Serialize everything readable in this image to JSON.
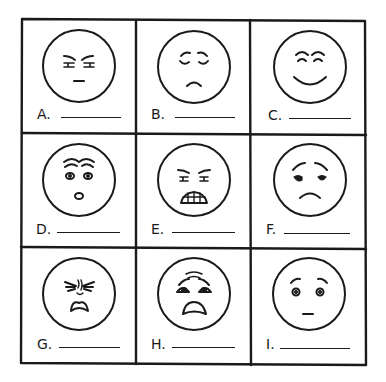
{
  "worksheet": {
    "grid": {
      "rows": 3,
      "columns": 3,
      "stroke_color": "#1a1a1a",
      "background": "#ffffff"
    },
    "cells": [
      {
        "label": "A.",
        "expression": "angry-frown",
        "blank": ""
      },
      {
        "label": "B.",
        "expression": "sad-eyes-closed",
        "blank": ""
      },
      {
        "label": "C.",
        "expression": "happy-smiling",
        "blank": ""
      },
      {
        "label": "D.",
        "expression": "surprised",
        "blank": ""
      },
      {
        "label": "E.",
        "expression": "furious-teeth",
        "blank": ""
      },
      {
        "label": "F.",
        "expression": "sad-worried",
        "blank": ""
      },
      {
        "label": "G.",
        "expression": "disgusted",
        "blank": ""
      },
      {
        "label": "H.",
        "expression": "scared",
        "blank": ""
      },
      {
        "label": "I.",
        "expression": "neutral-blank",
        "blank": ""
      }
    ]
  }
}
